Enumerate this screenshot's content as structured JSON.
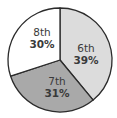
{
  "chart_data": {
    "type": "pie",
    "title": "",
    "categories": [
      "6th",
      "7th",
      "8th"
    ],
    "values": [
      39,
      31,
      30
    ],
    "unit": "%",
    "labels": [
      {
        "name": "6th",
        "pct": "39%"
      },
      {
        "name": "7th",
        "pct": "31%"
      },
      {
        "name": "8th",
        "pct": "30%"
      }
    ],
    "colors": [
      "#dcdcdc",
      "#a9a9a9",
      "#ffffff"
    ],
    "start_angle_deg": -90,
    "direction": "clockwise",
    "legend": "none (labels inside slices)"
  }
}
